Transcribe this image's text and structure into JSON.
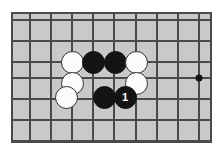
{
  "diagram": {
    "kind": "go-board-diagram",
    "board": {
      "background_color": "#c9c9c9",
      "frame_color": "#4a4a4a",
      "line_color": "#4a4a4a",
      "page_background": "#ffffff",
      "frame": {
        "x": 11,
        "y": 12,
        "width": 201,
        "height": 131
      },
      "grid": {
        "vertical_lines_x": [
          30,
          51,
          72,
          93,
          114,
          136,
          157,
          178,
          199
        ],
        "horizontal_lines_y": [
          20,
          41,
          62,
          78,
          99,
          120,
          141
        ],
        "line_width": 1.4
      },
      "star_points": [
        {
          "name": "hoshi-right",
          "x": 199,
          "y": 78,
          "radius": 3.5,
          "color": "#141414"
        }
      ]
    },
    "stones": [
      {
        "id": "w1",
        "color": "white",
        "label": "",
        "x": 72,
        "y": 62
      },
      {
        "id": "b1",
        "color": "black",
        "label": "",
        "x": 93,
        "y": 62
      },
      {
        "id": "b2",
        "color": "black",
        "label": "",
        "x": 115,
        "y": 62
      },
      {
        "id": "w2",
        "color": "white",
        "label": "",
        "x": 136,
        "y": 62
      },
      {
        "id": "w3",
        "color": "white",
        "label": "",
        "x": 72,
        "y": 83
      },
      {
        "id": "w4",
        "color": "white",
        "label": "",
        "x": 136,
        "y": 83
      },
      {
        "id": "w5",
        "color": "white",
        "label": "",
        "x": 66,
        "y": 97
      },
      {
        "id": "b3",
        "color": "black",
        "label": "",
        "x": 104,
        "y": 97
      },
      {
        "id": "b4",
        "color": "black",
        "label": "1",
        "x": 125,
        "y": 97
      }
    ],
    "move_labels": [
      "1"
    ],
    "stone_radius": 11.5
  }
}
